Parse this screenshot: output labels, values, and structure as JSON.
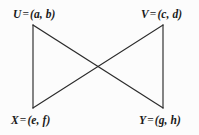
{
  "figure": {
    "background_color": "#fcfcfc",
    "line_color": "#2b2b2b",
    "text_color": "#1a1a1a",
    "equals_sign": "=",
    "vertices": [
      {
        "id": "U",
        "name": "U",
        "coordinates": "(a, b)",
        "full_label": "U = (a, b)",
        "position": "top-left",
        "x": 33,
        "y": 25
      },
      {
        "id": "V",
        "name": "V",
        "coordinates": "(c, d)",
        "full_label": "V = (c, d)",
        "position": "top-right",
        "x": 163,
        "y": 25
      },
      {
        "id": "X",
        "name": "X",
        "coordinates": "(e, f)",
        "full_label": "X = (e, f)",
        "position": "bottom-left",
        "x": 33,
        "y": 108
      },
      {
        "id": "Y",
        "name": "Y",
        "coordinates": "(g, h)",
        "full_label": "Y = (g, h)",
        "position": "bottom-right",
        "x": 163,
        "y": 108
      }
    ],
    "edges": [
      {
        "id": "U-X",
        "from": "U",
        "to": "X",
        "kind": "vertical-left"
      },
      {
        "id": "V-Y",
        "from": "V",
        "to": "Y",
        "kind": "vertical-right"
      },
      {
        "id": "U-Y",
        "from": "U",
        "to": "Y",
        "kind": "diagonal-down-right"
      },
      {
        "id": "V-X",
        "from": "V",
        "to": "X",
        "kind": "diagonal-down-left"
      }
    ],
    "crossing_point": {
      "x": 98,
      "y": 67
    }
  }
}
